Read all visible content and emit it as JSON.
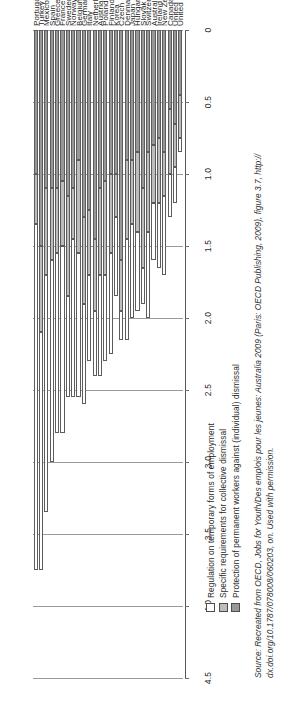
{
  "chart_data": {
    "type": "bar",
    "title": "",
    "subtitle": "",
    "orientation": "horizontal-stacked",
    "stacked": true,
    "xlabel": "",
    "ylabel": "",
    "xlim": [
      0,
      4.5
    ],
    "ticks": [
      "0",
      "0.5",
      "1.0",
      "1.5",
      "2.0",
      "2.5",
      "3.0",
      "3.5",
      "4.0",
      "4.5"
    ],
    "tick_values": [
      0,
      0.5,
      1.0,
      1.5,
      2.0,
      2.5,
      3.0,
      3.5,
      4.0,
      4.5
    ],
    "grid": true,
    "legend_position": "bottom-left",
    "categories": [
      "Portugal",
      "Turkey",
      "Mexico",
      "Spain",
      "Greece",
      "France",
      "Sweden",
      "Norway",
      "Belgium",
      "Germany",
      "Italy",
      "Netherlands",
      "Austria",
      "Poland",
      "Finland",
      "Korea",
      "Czech Republic",
      "Denmark",
      "Japan",
      "Hungary",
      "Slovak Republic",
      "Switzerland",
      "Australia",
      "Ireland",
      "New Zealand",
      "Canada",
      "United Kingdom",
      "United States"
    ],
    "series": [
      {
        "name": "Protection of permanent workers against (individual) dismissal",
        "color": "#989898",
        "values": [
          1.0,
          1.5,
          1.1,
          1.1,
          1.1,
          1.05,
          1.15,
          1.1,
          0.9,
          1.3,
          1.25,
          1.45,
          1.1,
          1.05,
          1.0,
          1.0,
          1.6,
          0.9,
          0.9,
          0.85,
          1.1,
          0.85,
          0.8,
          0.75,
          0.85,
          0.55,
          0.65,
          0.45
        ]
      },
      {
        "name": "Specific requirements for collective dismissal",
        "color": "#bdbdbd",
        "values": [
          0.35,
          0.6,
          0.6,
          0.5,
          0.45,
          0.45,
          0.7,
          0.35,
          0.65,
          0.6,
          0.45,
          0.5,
          0.6,
          0.65,
          0.55,
          0.3,
          0.35,
          0.55,
          0.45,
          0.55,
          0.55,
          0.55,
          0.4,
          0.45,
          0.3,
          0.45,
          0.3,
          0.3
        ]
      },
      {
        "name": "Regulation on temporary forms of employment",
        "color": "#ffffff",
        "values": [
          2.4,
          1.65,
          1.65,
          1.4,
          1.25,
          1.3,
          0.7,
          1.1,
          1.0,
          0.7,
          0.6,
          0.45,
          0.7,
          0.6,
          0.7,
          0.55,
          0.2,
          0.7,
          0.65,
          0.55,
          0.25,
          0.6,
          0.4,
          0.45,
          0.55,
          0.3,
          0.25,
          0.1
        ]
      }
    ]
  },
  "legend": {
    "items": [
      {
        "label": "Regulation on temporary forms of employment",
        "swatch": "s0"
      },
      {
        "label": "Specific requirements for collective dismissal",
        "swatch": "s1"
      },
      {
        "label": "Protection of permanent workers against (individual) dismissal",
        "swatch": "s2"
      }
    ]
  },
  "source": {
    "label": "Source:",
    "line1": "Recreated from OECD, Jobs for Youth/Des emplois pour les jeunes: Australia 2009 (Paris: OECD Publishing, 2009), figure 3.7, http://",
    "line2": "dx.doi.org/10.1787/078008/060203, on. Used with permission."
  }
}
